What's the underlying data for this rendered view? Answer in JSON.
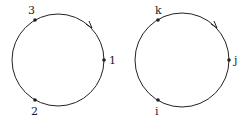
{
  "diagrams": [
    {
      "name": "numeric-cycle",
      "center": [
        58,
        60
      ],
      "radius": 46,
      "direction": "clockwise",
      "points": [
        {
          "label": "3",
          "x": 35,
          "y": 20,
          "lx": 31,
          "ly": 12
        },
        {
          "label": "1",
          "x": 104,
          "y": 60,
          "lx": 109,
          "ly": 64
        },
        {
          "label": "2",
          "x": 35,
          "y": 100,
          "lx": 31,
          "ly": 116
        }
      ]
    },
    {
      "name": "letter-cycle",
      "center": [
        182,
        60
      ],
      "radius": 47,
      "direction": "clockwise",
      "points": [
        {
          "label": "k",
          "x": 158,
          "y": 20,
          "lx": 154,
          "ly": 12
        },
        {
          "label": "j",
          "x": 229,
          "y": 60,
          "lx": 234,
          "ly": 64
        },
        {
          "label": "i",
          "x": 158,
          "y": 100,
          "lx": 155,
          "ly": 116
        }
      ]
    }
  ],
  "colors": {
    "stroke": "#222222",
    "background": "#ffffff"
  }
}
